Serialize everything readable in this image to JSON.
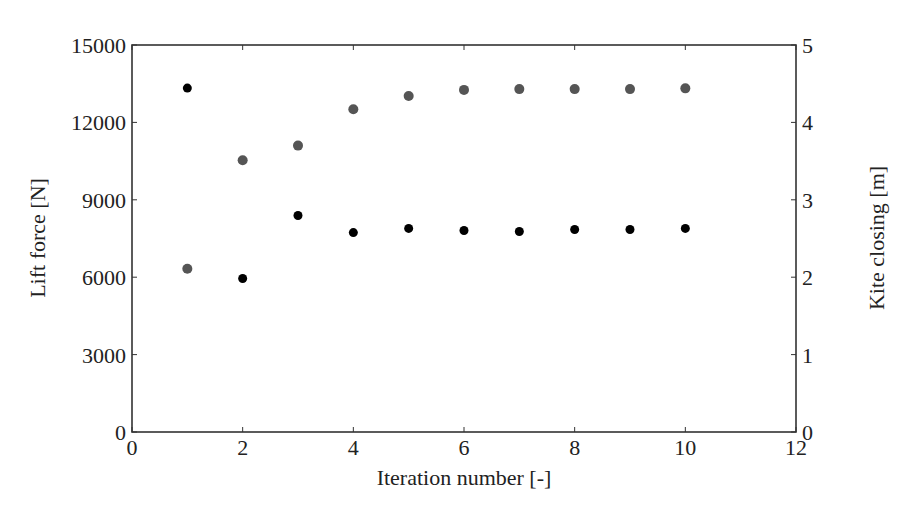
{
  "chart_data": {
    "type": "scatter",
    "title": "",
    "xlabel": "Iteration number [-]",
    "ylabel": "Lift force [N]",
    "ylabel_right": "Kite closing [m]",
    "xlim": [
      0,
      12
    ],
    "ylim": [
      0,
      15000
    ],
    "ylim_right": [
      0,
      5
    ],
    "x_ticks": [
      0,
      2,
      4,
      6,
      8,
      10,
      12
    ],
    "y_ticks": [
      0,
      3000,
      6000,
      9000,
      12000,
      15000
    ],
    "y_ticks_right": [
      0,
      1,
      2,
      3,
      4,
      5
    ],
    "grid": false,
    "legend": null,
    "series": [
      {
        "name": "Lift force",
        "axis": "left",
        "color": "#000000",
        "x": [
          1,
          2,
          3,
          4,
          5,
          6,
          7,
          8,
          9,
          10
        ],
        "values": [
          13330,
          5950,
          8390,
          7730,
          7890,
          7810,
          7770,
          7850,
          7850,
          7890
        ]
      },
      {
        "name": "Kite closing",
        "axis": "right",
        "color": "#555555",
        "x": [
          1,
          2,
          3,
          4,
          5,
          6,
          7,
          8,
          9,
          10
        ],
        "values": [
          2.11,
          3.51,
          3.7,
          4.17,
          4.34,
          4.42,
          4.43,
          4.43,
          4.43,
          4.44
        ]
      }
    ]
  },
  "layout": {
    "plot_left": 132,
    "plot_right": 796,
    "plot_top": 45,
    "plot_bottom": 432
  }
}
